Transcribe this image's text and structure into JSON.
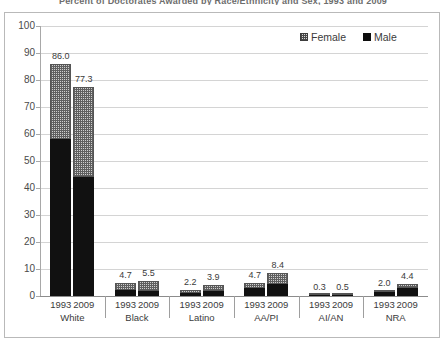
{
  "chart_data": {
    "type": "bar",
    "title": "Percent of Doctorates Awarded by Race/Ethnicity and Sex, 1993 and 2009",
    "xlabel": "",
    "ylabel": "",
    "ylim": [
      0,
      100
    ],
    "ytick_step": 10,
    "yticks": [
      "100",
      "90",
      "80",
      "70",
      "60",
      "50",
      "40",
      "30",
      "20",
      "10",
      "0"
    ],
    "grid": true,
    "stacked": true,
    "legend_position": "top-right",
    "legend": [
      {
        "name": "Female",
        "pattern": "checkered-hatch",
        "color": "#cfcfcf"
      },
      {
        "name": "Male",
        "pattern": "solid",
        "color": "#111111"
      }
    ],
    "categories": [
      "White",
      "Black",
      "Latino",
      "AA/PI",
      "AI/AN",
      "NRA"
    ],
    "years": [
      "1993",
      "2009"
    ],
    "bars": [
      {
        "group": "White",
        "year": "1993",
        "total": 86.0,
        "total_label": "86.0",
        "male": 58.0,
        "female": 28.0
      },
      {
        "group": "White",
        "year": "2009",
        "total": 77.3,
        "total_label": "77.3",
        "male": 44.0,
        "female": 33.3
      },
      {
        "group": "Black",
        "year": "1993",
        "total": 4.7,
        "total_label": "4.7",
        "male": 2.1,
        "female": 2.6
      },
      {
        "group": "Black",
        "year": "2009",
        "total": 5.5,
        "total_label": "5.5",
        "male": 2.0,
        "female": 3.5
      },
      {
        "group": "Latino",
        "year": "1993",
        "total": 2.2,
        "total_label": "2.2",
        "male": 1.2,
        "female": 1.0
      },
      {
        "group": "Latino",
        "year": "2009",
        "total": 3.9,
        "total_label": "3.9",
        "male": 1.7,
        "female": 2.2
      },
      {
        "group": "AA/PI",
        "year": "1993",
        "total": 4.7,
        "total_label": "4.7",
        "male": 2.9,
        "female": 1.8
      },
      {
        "group": "AA/PI",
        "year": "2009",
        "total": 8.4,
        "total_label": "8.4",
        "male": 4.6,
        "female": 3.8
      },
      {
        "group": "AI/AN",
        "year": "1993",
        "total": 0.3,
        "total_label": "0.3",
        "male": 0.15,
        "female": 0.15
      },
      {
        "group": "AI/AN",
        "year": "2009",
        "total": 0.5,
        "total_label": "0.5",
        "male": 0.2,
        "female": 0.3
      },
      {
        "group": "NRA",
        "year": "1993",
        "total": 2.0,
        "total_label": "2.0",
        "male": 1.6,
        "female": 0.4
      },
      {
        "group": "NRA",
        "year": "2009",
        "total": 4.4,
        "total_label": "4.4",
        "male": 2.8,
        "female": 1.6
      }
    ]
  }
}
